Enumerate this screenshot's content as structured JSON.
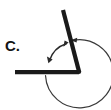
{
  "figure": {
    "label": "C.",
    "label_color": "#141414",
    "stroke_color": "#1a1a1a",
    "arc_color": "#333333",
    "background_color": "#ffffff",
    "width": 111,
    "height": 110,
    "vertex": {
      "x": 79,
      "y": 72
    },
    "rays": [
      {
        "name": "horizontal-ray",
        "from": {
          "x": 79,
          "y": 72
        },
        "to": {
          "x": 15,
          "y": 72
        },
        "thickness": 4
      },
      {
        "name": "slanted-ray",
        "from": {
          "x": 79,
          "y": 72
        },
        "to": {
          "x": 63,
          "y": 10
        },
        "thickness": 4
      }
    ],
    "arcs": [
      {
        "name": "interior-angle-arc",
        "radius": 36,
        "start_angle_deg": 180,
        "end_angle_deg": 284,
        "arrowheads": "both",
        "thickness": 1.4
      },
      {
        "name": "reflex-angle-arc",
        "radius": 31,
        "start_angle_deg": 180,
        "end_angle_deg": 284,
        "sweep": "reflex",
        "arrowheads": "end",
        "thickness": 1.2
      }
    ]
  }
}
